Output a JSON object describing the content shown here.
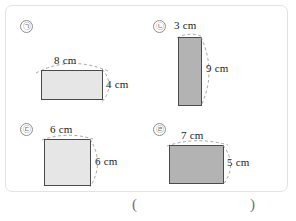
{
  "worksheet": {
    "answer_blank": {
      "open_paren": "(",
      "close_paren": ")"
    }
  },
  "figures": [
    {
      "marker": "㉠",
      "shape": "rectangle",
      "fill": "#e6e6e6",
      "top_label": "8 cm",
      "side_label": "4 cm",
      "width_cm": 8,
      "height_cm": 4
    },
    {
      "marker": "㉡",
      "shape": "rectangle",
      "fill": "#b3b3b3",
      "top_label": "3 cm",
      "side_label": "9 cm",
      "width_cm": 3,
      "height_cm": 9
    },
    {
      "marker": "㉢",
      "shape": "square",
      "fill": "#e6e6e6",
      "top_label": "6 cm",
      "side_label": "6 cm",
      "width_cm": 6,
      "height_cm": 6
    },
    {
      "marker": "㉣",
      "shape": "rectangle",
      "fill": "#b3b3b3",
      "top_label": "7 cm",
      "side_label": "5 cm",
      "width_cm": 7,
      "height_cm": 5
    }
  ]
}
